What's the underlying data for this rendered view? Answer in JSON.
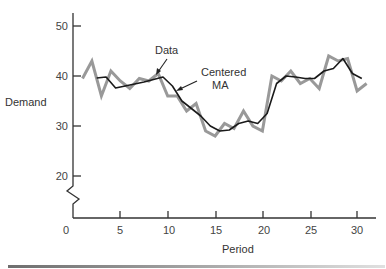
{
  "chart_data": {
    "type": "line",
    "title": "",
    "xlabel": "Period",
    "ylabel": "Demand",
    "xlim": [
      0,
      32
    ],
    "ylim": [
      15,
      52
    ],
    "y_axis_break": true,
    "grid": false,
    "x_ticks": [
      0,
      5,
      10,
      15,
      20,
      25,
      30
    ],
    "y_ticks": [
      20,
      30,
      40,
      50
    ],
    "series": [
      {
        "name": "Data",
        "color": "#999999",
        "line_width": 3,
        "x": [
          1,
          2,
          3,
          4,
          5,
          6,
          7,
          8,
          9,
          10,
          11,
          12,
          13,
          14,
          15,
          16,
          17,
          18,
          19,
          20,
          21,
          22,
          23,
          24,
          25,
          26,
          27,
          28,
          29,
          30,
          31
        ],
        "values": [
          39.5,
          43,
          36,
          41,
          39,
          37.5,
          39.5,
          39,
          40.5,
          36,
          36,
          33,
          34.5,
          29,
          28,
          30.5,
          29.5,
          33,
          30,
          29,
          40,
          39,
          41,
          38.5,
          39.5,
          37.5,
          44,
          43,
          43.5,
          37,
          38.5
        ]
      },
      {
        "name": "Centered MA",
        "color": "#1a1a1a",
        "line_width": 1.6,
        "x": [
          2.5,
          3.5,
          4.5,
          5.5,
          6.5,
          7.5,
          8.5,
          9.5,
          10.5,
          11.5,
          12.5,
          13.5,
          14.5,
          15.5,
          16.5,
          17.5,
          18.5,
          19.5,
          20.5,
          21.5,
          22.5,
          23.5,
          24.5,
          25.5,
          26.5,
          27.5,
          28.5,
          29.5,
          30.5
        ],
        "values": [
          39.6,
          39.8,
          37.6,
          38,
          38.4,
          38.8,
          39.3,
          39.8,
          38,
          35,
          33.5,
          32,
          30,
          29,
          29.2,
          30.5,
          31,
          30.5,
          32.5,
          38.5,
          40,
          39.8,
          39.5,
          39.5,
          41,
          41.5,
          43.5,
          40.5,
          39.5
        ]
      }
    ],
    "annotations": [
      {
        "text": "Data",
        "points_to": "Data",
        "near_x": 9,
        "near_y": 40.5
      },
      {
        "text": "Centered\nMA",
        "points_to": "Centered MA",
        "near_x": 11,
        "near_y": 37
      }
    ]
  },
  "labels": {
    "ylabel": "Demand",
    "xlabel": "Period",
    "anno_data": "Data",
    "anno_ma_line1": "Centered",
    "anno_ma_line2": "MA",
    "x_ticks": [
      "0",
      "5",
      "10",
      "15",
      "20",
      "25",
      "30"
    ],
    "y_ticks": [
      "50",
      "40",
      "30",
      "20"
    ]
  }
}
